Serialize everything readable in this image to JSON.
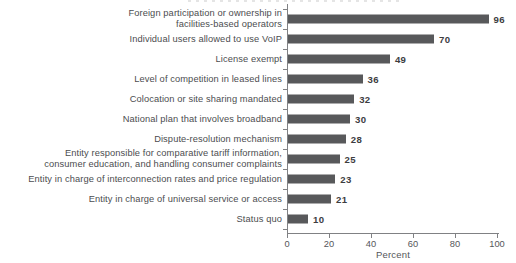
{
  "chart_data": {
    "type": "bar",
    "orientation": "horizontal",
    "categories": [
      "Foreign participation or ownership in\nfacilities-based operators",
      "Individual users allowed to use VoIP",
      "License exempt",
      "Level of competition in leased lines",
      "Colocation or site sharing mandated",
      "National plan that involves broadband",
      "Dispute-resolution mechanism",
      "Entity responsible for comparative tariff information,\nconsumer education, and handling consumer complaints",
      "Entity in charge of interconnection rates and price regulation",
      "Entity in charge of universal service or access",
      "Status quo"
    ],
    "values": [
      96,
      70,
      49,
      36,
      32,
      30,
      28,
      25,
      23,
      21,
      10
    ],
    "xlabel": "Percent",
    "xlim": [
      0,
      100
    ],
    "x_ticks": [
      0,
      20,
      40,
      60,
      80,
      100
    ],
    "value_labels_shown": true,
    "grid": false,
    "legend": "none",
    "bar_color": "#58595b",
    "value_label_color": "#3d3d3f",
    "category_label_color": "#4c4d4f",
    "axis_color": "#808184"
  }
}
